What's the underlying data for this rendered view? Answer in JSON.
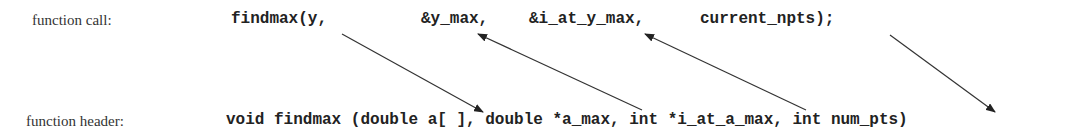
{
  "labels": {
    "call": "function call:",
    "header": "function header:"
  },
  "call_args": [
    {
      "text": "findmax(y,",
      "x": 231
    },
    {
      "text": "&y_max,",
      "x": 421
    },
    {
      "text": "&i_at_y_max,",
      "x": 529
    },
    {
      "text": "current_npts);",
      "x": 700
    }
  ],
  "header_text": "void findmax (double a[ ], double *a_max, int *i_at_a_max, int num_pts)",
  "arrows": [
    {
      "from": "y",
      "to": "a[ ]",
      "direction": "call-to-header"
    },
    {
      "from": "*a_max",
      "to": "&y_max",
      "direction": "header-to-call"
    },
    {
      "from": "*i_at_a_max",
      "to": "&i_at_y_max",
      "direction": "header-to-call"
    },
    {
      "from": "current_npts",
      "to": "num_pts",
      "direction": "call-to-header"
    }
  ]
}
